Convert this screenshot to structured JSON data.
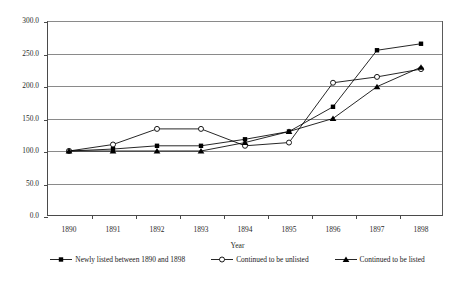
{
  "chart_data": {
    "type": "line",
    "title": "",
    "xlabel": "Year",
    "ylabel": "",
    "categories": [
      "1890",
      "1891",
      "1892",
      "1893",
      "1894",
      "1895",
      "1896",
      "1897",
      "1898"
    ],
    "x": [
      1890,
      1891,
      1892,
      1893,
      1894,
      1895,
      1896,
      1897,
      1898
    ],
    "ylim": [
      0.0,
      300.0
    ],
    "yticks": [
      0.0,
      50.0,
      100.0,
      150.0,
      200.0,
      250.0,
      300.0
    ],
    "ytick_labels": [
      "0.0",
      "50.0",
      "100.0",
      "150.0",
      "200.0",
      "250.0",
      "300.0"
    ],
    "xtick_labels": [
      "1890",
      "1891",
      "1892",
      "1893",
      "1894",
      "1895",
      "1896",
      "1897",
      "1898"
    ],
    "grid": true,
    "legend_position": "bottom",
    "series": [
      {
        "name": "Newly listed between 1890 and 1898",
        "marker": "filled-square",
        "color": "#000000",
        "values": [
          100,
          103,
          108,
          108,
          118,
          130,
          168,
          255,
          265
        ]
      },
      {
        "name": "Continued to be unlisted",
        "marker": "open-circle",
        "color": "#000000",
        "values": [
          100,
          110,
          134,
          134,
          108,
          113,
          205,
          214,
          226
        ]
      },
      {
        "name": "Continued to be listed",
        "marker": "filled-triangle",
        "color": "#000000",
        "values": [
          100,
          100,
          100,
          100,
          113,
          130,
          150,
          199,
          229
        ]
      }
    ]
  },
  "axis": {
    "x_title": "Year"
  },
  "legend": {
    "items": [
      {
        "label": "Newly listed between 1890 and 1898",
        "marker": "filled-square"
      },
      {
        "label": "Continued to be unlisted",
        "marker": "open-circle"
      },
      {
        "label": "Continued to be listed",
        "marker": "filled-triangle"
      }
    ]
  }
}
